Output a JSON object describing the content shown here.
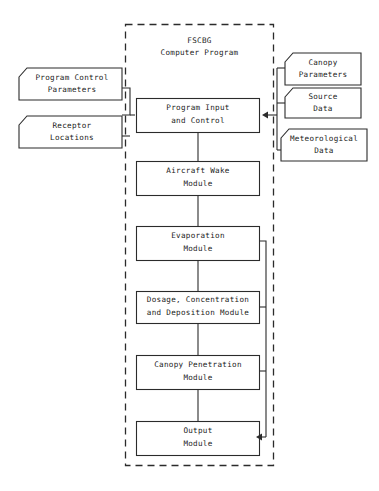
{
  "diagram": {
    "title_line1": "FSCBG",
    "title_line2": "Computer Program",
    "boundary_name": "FSCBG Computer Program boundary"
  },
  "left_inputs": [
    {
      "line1": "Program Control",
      "line2": "Parameters"
    },
    {
      "line1": "Receptor",
      "line2": "Locations"
    }
  ],
  "right_inputs": [
    {
      "line1": "Canopy",
      "line2": "Parameters"
    },
    {
      "line1": "Source",
      "line2": "Data"
    },
    {
      "line1": "Meteorological",
      "line2": "Data"
    }
  ],
  "modules": [
    {
      "line1": "Program Input",
      "line2": "and Control"
    },
    {
      "line1": "Aircraft Wake",
      "line2": "Module"
    },
    {
      "line1": "Evaporation",
      "line2": "Module"
    },
    {
      "line1": "Dosage, Concentration",
      "line2": "and Deposition Module"
    },
    {
      "line1": "Canopy Penetration",
      "line2": "Module"
    },
    {
      "line1": "Output",
      "line2": "Module"
    }
  ],
  "colors": {
    "stroke": "#2b2b2b",
    "text": "#1a1a1a",
    "background": "#ffffff"
  }
}
